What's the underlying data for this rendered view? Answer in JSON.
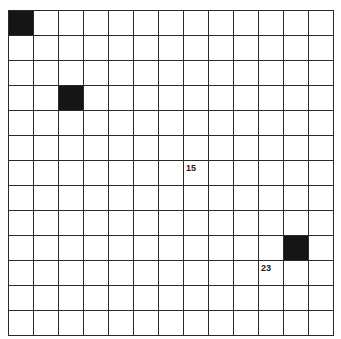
{
  "puzzle": {
    "rows": 13,
    "cols": 13,
    "black_cells": [
      {
        "row": 0,
        "col": 0
      },
      {
        "row": 3,
        "col": 2
      },
      {
        "row": 9,
        "col": 11
      }
    ],
    "numbered_cells": [
      {
        "row": 6,
        "col": 7,
        "number": "15"
      },
      {
        "row": 10,
        "col": 10,
        "number": "23"
      }
    ],
    "colors": {
      "grid_line": "#2a2a2a",
      "black_cell": "#151515",
      "white_cell": "#ffffff"
    }
  }
}
